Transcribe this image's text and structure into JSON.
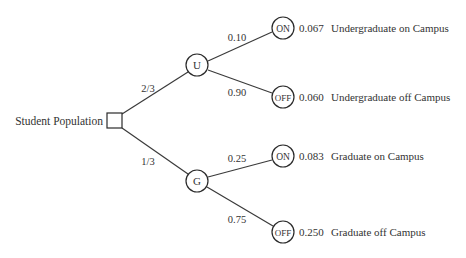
{
  "diagram": {
    "type": "probability-tree",
    "root": {
      "label": "Student Population",
      "shape": "square",
      "x": 115,
      "y": 121
    },
    "branches": [
      {
        "node": {
          "label": "U",
          "x": 197,
          "y": 65
        },
        "probability": "2/3",
        "prob_pos": {
          "x": 146,
          "y": 92
        },
        "children": [
          {
            "node_label": "ON",
            "x": 283,
            "y": 28,
            "probability": "0.10",
            "prob_pos": {
              "x": 237,
              "y": 40
            },
            "joint": "0.067",
            "outcome": "Undergraduate on Campus"
          },
          {
            "node_label": "OFF",
            "x": 283,
            "y": 97,
            "probability": "0.90",
            "prob_pos": {
              "x": 237,
              "y": 96
            },
            "joint": "0.060",
            "outcome": "Undergraduate off Campus"
          }
        ]
      },
      {
        "node": {
          "label": "G",
          "x": 197,
          "y": 181
        },
        "probability": "1/3",
        "prob_pos": {
          "x": 146,
          "y": 164
        },
        "children": [
          {
            "node_label": "ON",
            "x": 283,
            "y": 156,
            "probability": "0.25",
            "prob_pos": {
              "x": 237,
              "y": 161
            },
            "joint": "0.083",
            "outcome": "Graduate on Campus"
          },
          {
            "node_label": "OFF",
            "x": 283,
            "y": 232,
            "probability": "0.75",
            "prob_pos": {
              "x": 237,
              "y": 223
            },
            "joint": "0.250",
            "outcome": "Graduate off Campus"
          }
        ]
      }
    ]
  },
  "colors": {
    "line": "#3a3a3a",
    "text": "#333333",
    "background": "#ffffff"
  }
}
